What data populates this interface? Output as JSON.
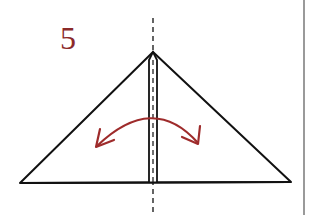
{
  "diagram": {
    "step_number": "5",
    "colors": {
      "step_number": "#8b2a2a",
      "arrow": "#9e2b2b",
      "lines": "#111111",
      "border": "#9a9a9a",
      "background": "#ffffff"
    },
    "elements": {
      "triangle": "folded-paper-triangle",
      "center_strip": "narrow-center-flap",
      "center_line": "dashed-fold-line",
      "arrow": "double-headed-curved-arrow"
    }
  }
}
